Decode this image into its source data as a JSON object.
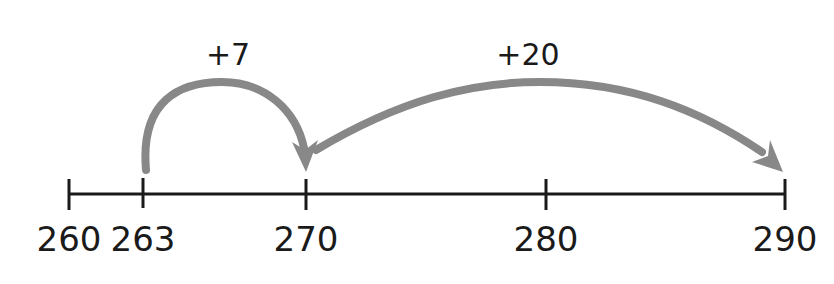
{
  "number_line": {
    "ticks": [
      {
        "value": "260",
        "x": 69
      },
      {
        "value": "263",
        "x": 143
      },
      {
        "value": "270",
        "x": 306
      },
      {
        "value": "280",
        "x": 546
      },
      {
        "value": "290",
        "x": 785
      }
    ],
    "line_color": "#1a1a1a"
  },
  "jumps": [
    {
      "label": "+7",
      "from": "263",
      "to": "270"
    },
    {
      "label": "+20",
      "from": "270",
      "to": "290"
    }
  ],
  "arrow_color": "#888888"
}
